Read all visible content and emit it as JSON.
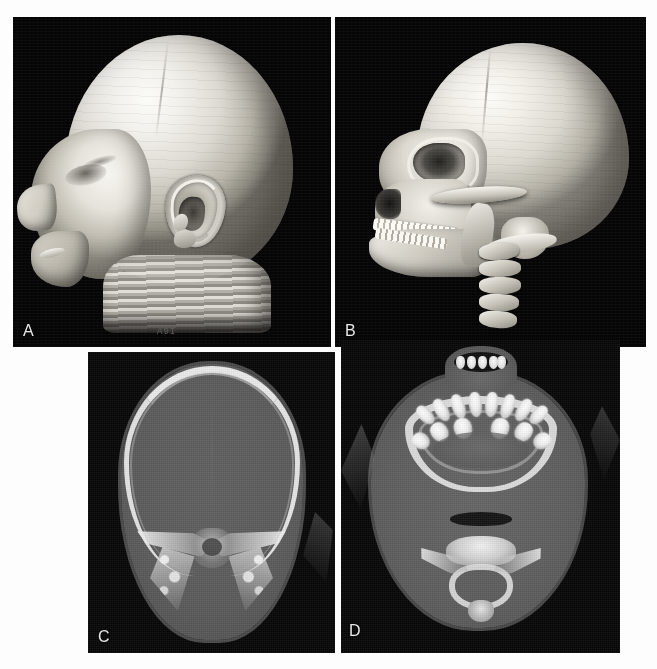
{
  "figure": {
    "type": "multi-panel-radiology-figure",
    "width": 657,
    "height": 669,
    "background_color": "#fdfdfd",
    "panel_background_color": "#050505",
    "soft_tissue_gray": "#5a5a5a",
    "bone_white": "#f0f0f0",
    "air_black": "#0d0d0d",
    "layout": "2x2 grid"
  },
  "panels": [
    {
      "id": "A",
      "label": "A",
      "modality": "3D CT surface (skin) rendering",
      "view": "right lateral",
      "subject": "infant head",
      "annotation": "A9I",
      "features": [
        "smooth scalp surface",
        "external ear / pinna with helix and concha",
        "nasal profile",
        "lips and chin",
        "orbital shadow",
        "stair-step scan ring artifacts at neck"
      ],
      "bounds": {
        "x": 13,
        "y": 17,
        "w": 318,
        "h": 330
      }
    },
    {
      "id": "B",
      "label": "B",
      "modality": "3D CT bone rendering",
      "view": "right lateral oblique",
      "subject": "infant skull and cervical spine",
      "annotation": "",
      "features": [
        "calvarium with coronal suture",
        "orbital rim and orbit",
        "zygomatic arch",
        "maxilla with deciduous teeth",
        "mandible and ramus",
        "mastoid region",
        "cervical vertebrae C1-C5"
      ],
      "bounds": {
        "x": 335,
        "y": 17,
        "w": 311,
        "h": 330
      }
    },
    {
      "id": "C",
      "label": "C",
      "modality": "Axial CT",
      "view": "axial",
      "subject": "skull base level",
      "annotation": "",
      "features": [
        "calvarium inner and outer table",
        "brain parenchyma",
        "petrous temporal bones",
        "mastoid air cells",
        "clivus / basiocciput",
        "interhemispheric falx"
      ],
      "bounds": {
        "x": 88,
        "y": 352,
        "w": 247,
        "h": 301
      }
    },
    {
      "id": "D",
      "label": "D",
      "modality": "Axial CT",
      "view": "axial",
      "subject": "maxilla / upper cervical level",
      "annotation": "",
      "features": [
        "maxillary alveolar arch",
        "developing deciduous tooth buds",
        "hard palate",
        "oropharyngeal airway",
        "cervical vertebra with spinal canal",
        "vertebral laminae and spinous process"
      ],
      "bounds": {
        "x": 341,
        "y": 340,
        "w": 279,
        "h": 313
      }
    }
  ],
  "teeth": {
    "upper_row": [
      {
        "left": 14,
        "top": 8,
        "w": 13,
        "h": 22,
        "rot": -44
      },
      {
        "left": 30,
        "top": 2,
        "w": 13,
        "h": 24,
        "rot": -30
      },
      {
        "left": 47,
        "top": -2,
        "w": 13,
        "h": 25,
        "rot": -18
      },
      {
        "left": 64,
        "top": -4,
        "w": 13,
        "h": 25,
        "rot": -6
      },
      {
        "left": 80,
        "top": -4,
        "w": 13,
        "h": 25,
        "rot": 6
      },
      {
        "left": 96,
        "top": -2,
        "w": 13,
        "h": 25,
        "rot": 18
      },
      {
        "left": 112,
        "top": 2,
        "w": 13,
        "h": 24,
        "rot": 30
      },
      {
        "left": 127,
        "top": 8,
        "w": 13,
        "h": 22,
        "rot": 44
      }
    ],
    "lower_row": [
      {
        "left": 8,
        "top": 36,
        "w": 16,
        "h": 18,
        "rot": -58
      },
      {
        "left": 26,
        "top": 26,
        "w": 17,
        "h": 20,
        "rot": -36
      },
      {
        "left": 49,
        "top": 22,
        "w": 18,
        "h": 21,
        "rot": -14
      },
      {
        "left": 86,
        "top": 22,
        "w": 18,
        "h": 21,
        "rot": 14
      },
      {
        "left": 110,
        "top": 26,
        "w": 17,
        "h": 20,
        "rot": 36
      },
      {
        "left": 129,
        "top": 36,
        "w": 16,
        "h": 18,
        "rot": 58
      }
    ],
    "incisors": [
      0,
      11,
      22,
      33,
      41
    ],
    "count_visible": 14
  },
  "vertebrae_panel_b": [
    {
      "top": 0,
      "w": 40,
      "rot": -4
    },
    {
      "top": 17,
      "w": 42,
      "rot": -2
    },
    {
      "top": 34,
      "w": 42,
      "rot": 0
    },
    {
      "top": 51,
      "w": 40,
      "rot": 2
    },
    {
      "top": 68,
      "w": 38,
      "rot": 4
    }
  ]
}
